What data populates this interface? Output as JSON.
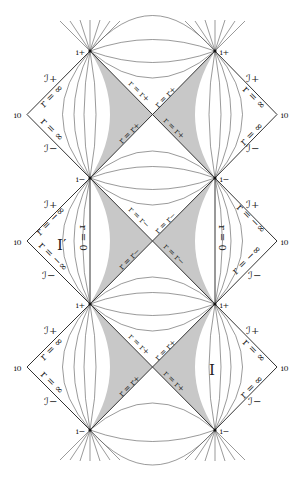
{
  "figure": {
    "colors": {
      "line": "#333333",
      "shade": "#c8c8c8",
      "background": "#ffffff"
    },
    "geometry": {
      "left_x": 90,
      "right_x": 215,
      "vertex_y": [
        51,
        178,
        304,
        430
      ],
      "i0_left_x": 27,
      "i0_right_x": 277
    },
    "vertex_labels": {
      "top_left": "i+",
      "top_right": "i+",
      "row1_left": "i−",
      "row1_right": "i−",
      "row2_left": "i+",
      "row2_right": "i+",
      "bottom_left": "i−",
      "bottom_right": "i−"
    },
    "blocks": [
      {
        "name": "upper",
        "horizon_labels": [
          "r = r+",
          "r = r+",
          "r = r+",
          "r = r+"
        ],
        "left_outer": {
          "scri_plus": "ℐ+",
          "scri_minus": "ℐ−",
          "i0": "i0",
          "r_upper": "r = ∞",
          "r_lower": "r = ∞"
        },
        "right_outer": {
          "scri_plus": "ℐ+",
          "scri_minus": "ℐ−",
          "i0": "i0",
          "r_upper": "r = ∞",
          "r_lower": "r = ∞"
        }
      },
      {
        "name": "middle",
        "horizon_labels": [
          "r = r−",
          "r = r−",
          "r = r−",
          "r = r−"
        ],
        "left_outer": {
          "scri_plus": "ℐ+",
          "scri_minus": "ℐ−",
          "i0": "i0",
          "r_upper": "r = −∞",
          "r_lower": "r = −∞",
          "region": "I′"
        },
        "right_outer": {
          "scri_plus": "ℐ+",
          "scri_minus": "ℐ−",
          "i0": "i0",
          "r_upper": "r = −∞",
          "r_lower": "r = −∞"
        },
        "singularity_labels": [
          "r = 0",
          "r = 0"
        ]
      },
      {
        "name": "lower",
        "horizon_labels": [
          "r = r+",
          "r = r+",
          "r = r+",
          "r = r+"
        ],
        "left_outer": {
          "scri_plus": "ℐ+",
          "scri_minus": "ℐ−",
          "i0": "i0",
          "r_upper": "r = ∞",
          "r_lower": "r = ∞"
        },
        "right_outer": {
          "scri_plus": "ℐ+",
          "scri_minus": "ℐ−",
          "i0": "i0",
          "r_upper": "r = ∞",
          "r_lower": "r = ∞",
          "region": "I"
        }
      }
    ]
  }
}
